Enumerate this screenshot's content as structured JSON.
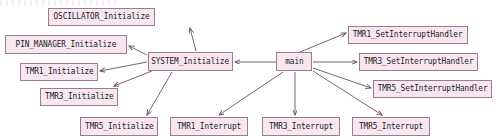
{
  "diagram": {
    "type": "call-graph",
    "style": "doxygen",
    "colors": {
      "node_fill": "#f8e7f1",
      "node_border": "#9c7d90",
      "edge": "#6b5160",
      "text": "#1a1a1a",
      "background": "#ffffff"
    },
    "root": "main",
    "nodes": [
      {
        "id": "oscillator_initialize",
        "label": "OSCILLATOR_Initialize",
        "x": 48,
        "y": 8,
        "w": 107,
        "h": 18
      },
      {
        "id": "pin_manager_initialize",
        "label": "PIN_MANAGER_Initialize",
        "x": 5,
        "y": 35,
        "w": 122,
        "h": 19
      },
      {
        "id": "tmr1_initialize",
        "label": "TMR1_Initialize",
        "x": 20,
        "y": 63,
        "w": 78,
        "h": 18
      },
      {
        "id": "tmr3_initialize",
        "label": "TMR3_Initialize",
        "x": 40,
        "y": 88,
        "w": 78,
        "h": 18
      },
      {
        "id": "tmr5_initialize",
        "label": "TMR5_Initialize",
        "x": 80,
        "y": 117,
        "w": 78,
        "h": 19
      },
      {
        "id": "system_initialize",
        "label": "SYSTEM_Initialize",
        "x": 148,
        "y": 52,
        "w": 85,
        "h": 19
      },
      {
        "id": "main",
        "label": "main",
        "x": 276,
        "y": 52,
        "w": 36,
        "h": 19
      },
      {
        "id": "tmr1_setinterrupthandler",
        "label": "TMR1_SetInterruptHandler",
        "x": 348,
        "y": 26,
        "w": 120,
        "h": 18
      },
      {
        "id": "tmr3_setinterrupthandler",
        "label": "TMR3_SetInterruptHandler",
        "x": 359,
        "y": 53,
        "w": 119,
        "h": 18
      },
      {
        "id": "tmr5_setinterrupthandler",
        "label": "TMR5_SetInterruptHandler",
        "x": 373,
        "y": 80,
        "w": 119,
        "h": 18
      },
      {
        "id": "tmr1_interrupt",
        "label": "TMR1_Interrupt",
        "x": 170,
        "y": 117,
        "w": 78,
        "h": 19
      },
      {
        "id": "tmr3_interrupt",
        "label": "TMR3_Interrupt",
        "x": 262,
        "y": 117,
        "w": 78,
        "h": 19
      },
      {
        "id": "tmr5_interrupt",
        "label": "TMR5_Interrupt",
        "x": 352,
        "y": 117,
        "w": 78,
        "h": 19
      }
    ],
    "edges": [
      {
        "from": "main",
        "to": "system_initialize",
        "x1": 276,
        "y1": 62,
        "x2": 235,
        "y2": 62
      },
      {
        "from": "main",
        "to": "tmr1_setinterrupthandler",
        "x1": 300,
        "y1": 52,
        "x2": 346,
        "y2": 33
      },
      {
        "from": "main",
        "to": "tmr3_setinterrupthandler",
        "x1": 313,
        "y1": 62,
        "x2": 357,
        "y2": 62
      },
      {
        "from": "main",
        "to": "tmr5_setinterrupthandler",
        "x1": 313,
        "y1": 68,
        "x2": 371,
        "y2": 88
      },
      {
        "from": "main",
        "to": "tmr5_interrupt",
        "x1": 313,
        "y1": 71,
        "x2": 382,
        "y2": 115
      },
      {
        "from": "main",
        "to": "tmr3_interrupt",
        "x1": 295,
        "y1": 72,
        "x2": 295,
        "y2": 115
      },
      {
        "from": "main",
        "to": "tmr1_interrupt",
        "x1": 283,
        "y1": 72,
        "x2": 219,
        "y2": 115
      },
      {
        "from": "system_initialize",
        "to": "oscillator_initialize",
        "x1": 196,
        "y1": 51,
        "x2": 190,
        "y2": 28
      },
      {
        "from": "system_initialize",
        "to": "pin_manager_initialize",
        "x1": 147,
        "y1": 55,
        "x2": 129,
        "y2": 46
      },
      {
        "from": "system_initialize",
        "to": "tmr1_initialize",
        "x1": 147,
        "y1": 62,
        "x2": 100,
        "y2": 71
      },
      {
        "from": "system_initialize",
        "to": "tmr3_initialize",
        "x1": 152,
        "y1": 71,
        "x2": 114,
        "y2": 86
      },
      {
        "from": "system_initialize",
        "to": "tmr5_initialize",
        "x1": 172,
        "y1": 72,
        "x2": 147,
        "y2": 115
      }
    ]
  }
}
